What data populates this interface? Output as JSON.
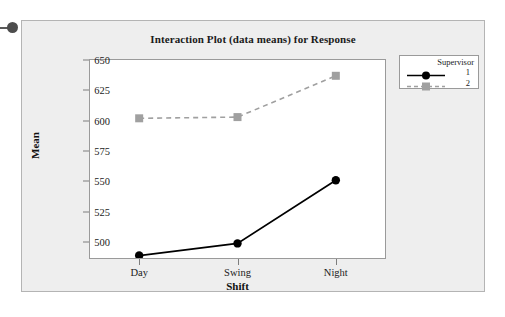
{
  "marker": {
    "name": "bullet-marker"
  },
  "chart_data": {
    "type": "line",
    "title": "Interaction Plot (data means) for Response",
    "xlabel": "Shift",
    "ylabel": "Mean",
    "categories": [
      "Day",
      "Swing",
      "Night"
    ],
    "yticks": [
      650,
      625,
      600,
      575,
      550,
      525,
      500
    ],
    "ylim": [
      487,
      650
    ],
    "grid": false,
    "legend_position": "top-right",
    "legend_title": "Supervisor",
    "series": [
      {
        "name": "1",
        "values": [
          489,
          499,
          551
        ],
        "color": "#000000",
        "linestyle": "solid",
        "marker": "circle"
      },
      {
        "name": "2",
        "values": [
          602,
          603,
          637
        ],
        "color": "#a0a0a0",
        "linestyle": "dashed",
        "marker": "square"
      }
    ]
  }
}
